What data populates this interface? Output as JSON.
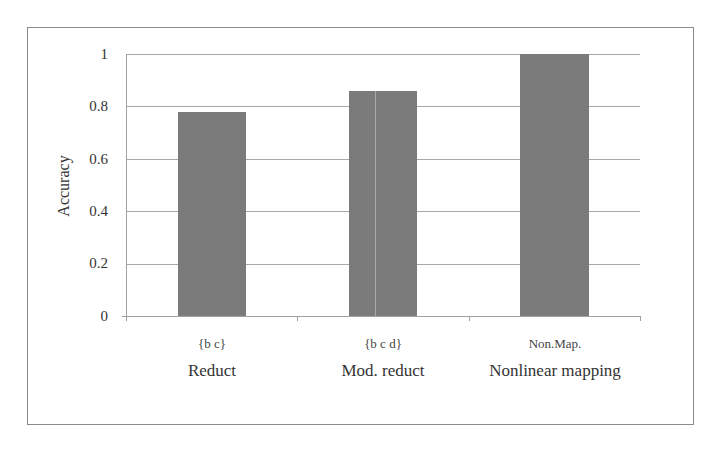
{
  "chart_data": {
    "type": "bar",
    "title": "",
    "xlabel": "",
    "ylabel": "Accuracy",
    "ylim": [
      0,
      1
    ],
    "yticks": [
      "0",
      "0.2",
      "0.4",
      "0.6",
      "0.8",
      "1"
    ],
    "grid": true,
    "legend": "none",
    "categories": [
      {
        "short": "{b c}",
        "label": "Reduct"
      },
      {
        "short": "{b c d}",
        "label": "Mod. reduct"
      },
      {
        "short": "Non.Map.",
        "label": "Nonlinear mapping"
      }
    ],
    "values": [
      0.78,
      0.86,
      1.0
    ],
    "bar_color": "#7b7b7b"
  }
}
